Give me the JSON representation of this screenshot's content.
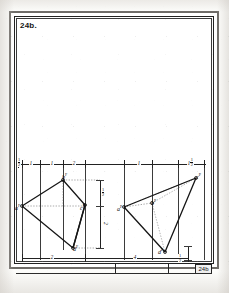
{
  "sheet": {
    "figure_label": "24b.",
    "titleblock_number": "24b"
  },
  "top_dimensions": [
    {
      "whole": "",
      "num": "1",
      "den": "2"
    },
    {
      "whole": "1",
      "num": "",
      "den": ""
    },
    {
      "whole": "1",
      "num": "",
      "den": ""
    },
    {
      "whole": "2",
      "num": "",
      "den": ""
    },
    {
      "whole": "1",
      "num": "",
      "den": ""
    },
    {
      "whole": "1",
      "num": "1",
      "den": "2"
    }
  ],
  "bottom_dimensions": [
    {
      "whole": "2",
      "num": "",
      "den": ""
    },
    {
      "whole": "4",
      "num": "",
      "den": ""
    },
    {
      "whole": "",
      "num": "1",
      "den": "2"
    }
  ],
  "vertical_dimensions": [
    {
      "whole": "",
      "num": "1",
      "den": "2"
    },
    {
      "whole": "2",
      "num": "",
      "den": ""
    }
  ],
  "left_figure": {
    "name": "quadrilateral-abcd",
    "vertices": [
      {
        "label": "a",
        "prime": "F",
        "x": 22,
        "y": 206
      },
      {
        "label": "b",
        "prime": "F",
        "x": 63,
        "y": 180
      },
      {
        "label": "c",
        "prime": "F",
        "x": 85,
        "y": 205
      },
      {
        "label": "d",
        "prime": "F",
        "x": 73,
        "y": 248
      }
    ]
  },
  "right_figure": {
    "name": "triangle-abc",
    "vertices": [
      {
        "label": "a",
        "prime": "P",
        "x": 124,
        "y": 207
      },
      {
        "label": "b",
        "prime": "P",
        "x": 152,
        "y": 203
      },
      {
        "label": "c",
        "prime": "P",
        "x": 196,
        "y": 178
      },
      {
        "label": "d",
        "prime": "P",
        "x": 165,
        "y": 252
      }
    ]
  },
  "colors": {
    "ink": "#1a1a1a",
    "line": "#3b3b3b",
    "paper": "#ffffff",
    "frame": "#6e6b67"
  }
}
